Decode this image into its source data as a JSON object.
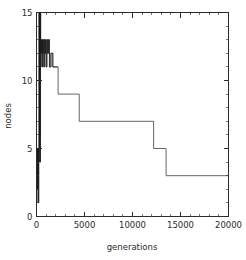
{
  "chart_data": {
    "type": "line",
    "title": "",
    "subtitle": "",
    "xlabel": "generations",
    "ylabel": "nodes",
    "xlim": [
      0,
      20000
    ],
    "ylim": [
      0,
      15
    ],
    "xticks": [
      0,
      5000,
      10000,
      15000,
      20000
    ],
    "xticklabels": [
      "0",
      "5000",
      "10000",
      "15000",
      "20000"
    ],
    "yticks": [
      0,
      5,
      10,
      15
    ],
    "yticklabels": [
      "0",
      "5",
      "10",
      "15"
    ],
    "x_minor_tick_interval": 1000,
    "y_minor_tick_interval": 1,
    "tick_direction": "in",
    "grid": false,
    "legend": null,
    "legend_position": "none",
    "annotations": [],
    "line_style": "step-post",
    "series": [
      {
        "name": "nodes",
        "description": "best-so-far node count per generation; monotonically non-increasing staircase after an initial dense oscillation phase",
        "points": [
          [
            0,
            1
          ],
          [
            40,
            5
          ],
          [
            60,
            3
          ],
          [
            90,
            5
          ],
          [
            110,
            2
          ],
          [
            140,
            5
          ],
          [
            160,
            3
          ],
          [
            190,
            5
          ],
          [
            200,
            1
          ],
          [
            230,
            5
          ],
          [
            250,
            4
          ],
          [
            270,
            15
          ],
          [
            300,
            5
          ],
          [
            320,
            15
          ],
          [
            340,
            6
          ],
          [
            360,
            15
          ],
          [
            380,
            4
          ],
          [
            400,
            15
          ],
          [
            430,
            13
          ],
          [
            470,
            12
          ],
          [
            520,
            13
          ],
          [
            560,
            11
          ],
          [
            610,
            13
          ],
          [
            650,
            12
          ],
          [
            700,
            13
          ],
          [
            760,
            11
          ],
          [
            820,
            13
          ],
          [
            880,
            12
          ],
          [
            940,
            13
          ],
          [
            1000,
            11
          ],
          [
            1080,
            13
          ],
          [
            1150,
            12
          ],
          [
            1250,
            13
          ],
          [
            1350,
            11
          ],
          [
            1500,
            12
          ],
          [
            1700,
            11
          ],
          [
            2200,
            11
          ],
          [
            2250,
            9
          ],
          [
            4400,
            9
          ],
          [
            4450,
            7
          ],
          [
            12150,
            7
          ],
          [
            12200,
            5
          ],
          [
            13450,
            5
          ],
          [
            13500,
            3
          ],
          [
            20000,
            3
          ]
        ],
        "plateaus": [
          {
            "value": 11,
            "x_start": 1700,
            "x_end": 2250
          },
          {
            "value": 9,
            "x_start": 2250,
            "x_end": 4450
          },
          {
            "value": 7,
            "x_start": 4450,
            "x_end": 12200
          },
          {
            "value": 5,
            "x_start": 12200,
            "x_end": 13500
          },
          {
            "value": 3,
            "x_start": 13500,
            "x_end": 20000
          }
        ]
      }
    ]
  }
}
